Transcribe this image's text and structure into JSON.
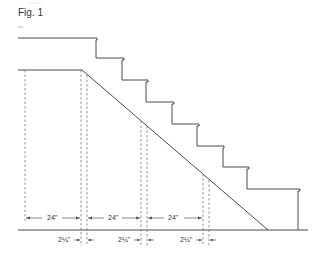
{
  "figure": {
    "label": "Fig. 1"
  },
  "stairs": {
    "top_landing": {
      "x1": 18,
      "x2": 97,
      "y": 38
    },
    "lower_landing": {
      "x1": 18,
      "x2": 82,
      "y": 70
    },
    "steps": [
      {
        "riser_x": 96,
        "tread_y": 58,
        "tread_end_x": 124
      },
      {
        "riser_x": 122,
        "tread_y": 80,
        "tread_end_x": 148
      },
      {
        "riser_x": 146,
        "tread_y": 102,
        "tread_end_x": 174
      },
      {
        "riser_x": 172,
        "tread_y": 124,
        "tread_end_x": 199
      },
      {
        "riser_x": 197,
        "tread_y": 146,
        "tread_end_x": 224
      },
      {
        "riser_x": 223,
        "tread_y": 167,
        "tread_end_x": 249
      },
      {
        "riser_x": 247,
        "tread_y": 189,
        "tread_end_x": 300
      }
    ],
    "last_riser_x": 298,
    "ground": {
      "x1": 18,
      "x2": 308,
      "y": 230
    },
    "diagonal": {
      "x1": 82,
      "y1": 70,
      "x2": 268,
      "y2": 230
    }
  },
  "dimensions": {
    "spacing_label": "24\"",
    "offset_label": "2¼\"",
    "spans": [
      {
        "label": "24\"",
        "x1": 25,
        "x2": 81
      },
      {
        "label": "24\"",
        "x1": 87,
        "x2": 141
      },
      {
        "label": "24\"",
        "x1": 147,
        "x2": 203
      }
    ],
    "offsets": [
      {
        "label": "2¼\"",
        "x1": 81,
        "x2": 87
      },
      {
        "label": "2¼\"",
        "x1": 141,
        "x2": 147
      },
      {
        "label": "2¼\"",
        "x1": 203,
        "x2": 209
      }
    ]
  }
}
